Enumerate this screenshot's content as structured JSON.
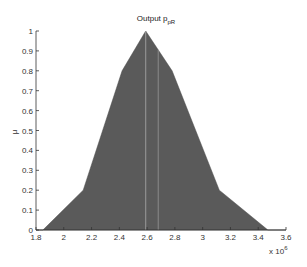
{
  "chart_data": {
    "type": "area",
    "title": "Output p",
    "title_subscript": "pR",
    "xlabel": "",
    "ylabel": "μ",
    "x_multiplier": "x 10",
    "x_multiplier_exponent": "6",
    "xlim": [
      1.8,
      3.6
    ],
    "ylim": [
      0,
      1
    ],
    "grid": false,
    "legend": null,
    "x_ticks": [
      "1.8",
      "2",
      "2.2",
      "2.4",
      "2.6",
      "2.8",
      "3",
      "3.2",
      "3.4",
      "3.6"
    ],
    "y_ticks": [
      "0",
      "0.1",
      "0.2",
      "0.3",
      "0.4",
      "0.5",
      "0.6",
      "0.7",
      "0.8",
      "0.9",
      "1"
    ],
    "series": [
      {
        "name": "membership",
        "fill": "#5a5a5a",
        "x": [
          1.8,
          1.85,
          2.14,
          2.42,
          2.59,
          2.78,
          3.12,
          3.47,
          3.6
        ],
        "y": [
          0,
          0,
          0.2,
          0.8,
          1.0,
          0.8,
          0.2,
          0,
          0
        ]
      }
    ],
    "vertical_lines": [
      {
        "x": 2.59,
        "color": "#9a9a9a"
      },
      {
        "x": 2.68,
        "color": "#8a8a8a"
      }
    ]
  }
}
